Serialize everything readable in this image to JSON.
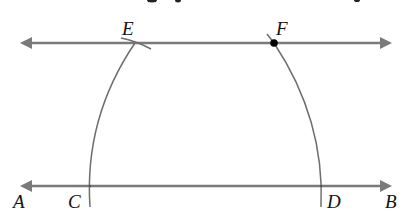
{
  "diagram": {
    "type": "geometric-construction",
    "colors": {
      "line": "#7a7a7a",
      "arc": "#6e6e6e",
      "point": "#000000",
      "label": "#111111"
    },
    "labels": {
      "A": "A",
      "B": "B",
      "C": "C",
      "D": "D",
      "E": "E",
      "F": "F"
    },
    "top_clipped_text": "…g p…    …"
  }
}
